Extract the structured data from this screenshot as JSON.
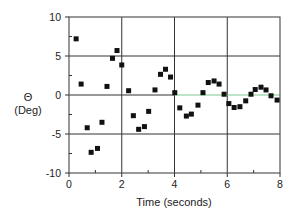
{
  "chart_data": {
    "type": "scatter",
    "title": "",
    "xlabel": "Time (seconds)",
    "ylabel_symbol": "Θ",
    "ylabel_unit": "(Deg)",
    "xlim": [
      0,
      8
    ],
    "ylim": [
      -10,
      10
    ],
    "xticks": [
      0,
      2,
      4,
      6,
      8
    ],
    "xtick_labels": [
      "0",
      "2",
      "4",
      "6",
      "8"
    ],
    "x_minor_ticks": [
      1,
      3,
      5,
      7
    ],
    "yticks": [
      -10,
      -5,
      0,
      5,
      10
    ],
    "ytick_labels": [
      "-10",
      "-5",
      "0",
      "5",
      "10"
    ],
    "y_minor_ticks": [
      -7.5,
      -2.5,
      2.5,
      7.5
    ],
    "grid": {
      "vertical_at": [
        2,
        4,
        6
      ],
      "horizontal_at": [
        -5,
        0,
        5
      ]
    },
    "legend": null,
    "zero_line_color_right": "#7fc98f",
    "marker": "square",
    "marker_color": "#111111",
    "series": [
      {
        "name": "Theta",
        "points": [
          [
            0.27,
            7.2
          ],
          [
            0.46,
            1.4
          ],
          [
            0.69,
            -4.2
          ],
          [
            0.84,
            -7.35
          ],
          [
            1.08,
            -6.85
          ],
          [
            1.25,
            -3.5
          ],
          [
            1.44,
            1.1
          ],
          [
            1.65,
            4.7
          ],
          [
            1.82,
            5.7
          ],
          [
            2.0,
            3.85
          ],
          [
            2.26,
            0.55
          ],
          [
            2.44,
            -2.65
          ],
          [
            2.64,
            -4.4
          ],
          [
            2.86,
            -4.05
          ],
          [
            3.02,
            -2.1
          ],
          [
            3.26,
            0.65
          ],
          [
            3.47,
            2.65
          ],
          [
            3.66,
            3.3
          ],
          [
            3.85,
            2.3
          ],
          [
            4.01,
            0.3
          ],
          [
            4.2,
            -1.65
          ],
          [
            4.45,
            -2.7
          ],
          [
            4.64,
            -2.45
          ],
          [
            4.89,
            -1.3
          ],
          [
            5.08,
            0.3
          ],
          [
            5.28,
            1.6
          ],
          [
            5.5,
            1.8
          ],
          [
            5.69,
            1.4
          ],
          [
            5.88,
            0.1
          ],
          [
            6.06,
            -1.1
          ],
          [
            6.26,
            -1.6
          ],
          [
            6.48,
            -1.5
          ],
          [
            6.7,
            -0.75
          ],
          [
            6.9,
            0.1
          ],
          [
            7.06,
            0.7
          ],
          [
            7.28,
            1.0
          ],
          [
            7.47,
            0.65
          ],
          [
            7.66,
            -0.1
          ],
          [
            7.89,
            -0.65
          ]
        ]
      }
    ]
  },
  "labels": {
    "ylabel_symbol": "Θ",
    "ylabel_unit": "(Deg)",
    "xlabel": "Time (seconds)"
  }
}
